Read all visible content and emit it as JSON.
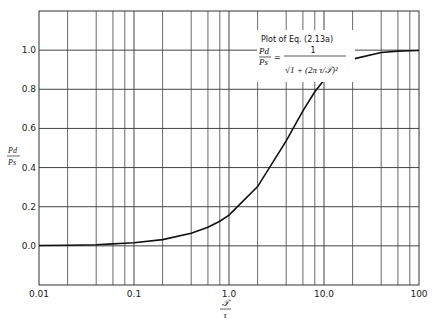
{
  "chart_data": {
    "type": "line",
    "title": "",
    "xscale": "log",
    "xlim": [
      0.01,
      100
    ],
    "ylim": [
      -0.2,
      1.2
    ],
    "x_ticks": [
      "0.01",
      "0.1",
      "1.0",
      "10.0",
      "100"
    ],
    "x_tick_values": [
      0.01,
      0.1,
      1,
      10,
      100
    ],
    "y_ticks": [
      "0.0",
      "0.2",
      "0.4",
      "0.6",
      "0.8",
      "1.0"
    ],
    "y_tick_values": [
      0,
      0.2,
      0.4,
      0.6,
      0.8,
      1.0
    ],
    "xlabel_num": "𝒯",
    "xlabel_den": "τ",
    "ylabel_num": "Pd",
    "ylabel_den": "Ps",
    "grid": true,
    "minor_grid_multipliers": [
      2,
      4,
      6,
      8
    ],
    "annotation": {
      "title": "Plot of Eq. (2.13a)",
      "lhs_num": "Pd",
      "lhs_den": "Ps",
      "rhs_num": "1",
      "rhs_den": "√1 + (2π τ/𝒯)²"
    },
    "series": [
      {
        "name": "Pd/Ps = 1/sqrt(1+(2π τ/𝒯)^2)",
        "x": [
          0.01,
          0.02,
          0.04,
          0.06,
          0.08,
          0.1,
          0.2,
          0.4,
          0.6,
          0.8,
          1.0,
          2.0,
          4.0,
          6.0,
          8.0,
          10.0,
          20.0,
          40.0,
          60.0,
          80.0,
          100.0
        ],
        "y": [
          0.002,
          0.003,
          0.006,
          0.01,
          0.013,
          0.016,
          0.032,
          0.064,
          0.095,
          0.126,
          0.157,
          0.303,
          0.537,
          0.69,
          0.787,
          0.847,
          0.954,
          0.988,
          0.995,
          0.997,
          0.998
        ]
      }
    ]
  }
}
